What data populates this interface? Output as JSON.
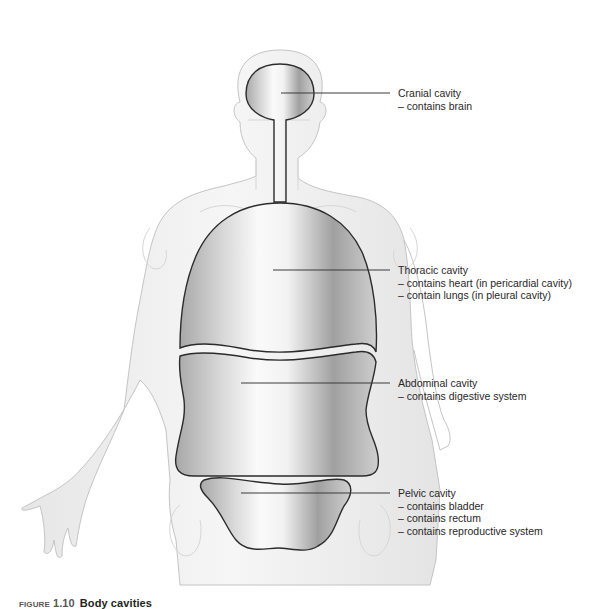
{
  "figure": {
    "caption_number": "FIGURE 1.10",
    "caption_title": "Body cavities"
  },
  "colors": {
    "body_fill": "#f0f0f0",
    "body_outline": "#c8c8c8",
    "cavity_outline": "#2b2b2b",
    "cavity_shade_dark": "#9a9a9a",
    "cavity_shade_light": "#f4f4f4",
    "leader_line": "#3a3a3a",
    "text": "#2a2627"
  },
  "labels": [
    {
      "id": "cranial",
      "title": "Cranial cavity",
      "lines": [
        "– contains brain"
      ]
    },
    {
      "id": "thoracic",
      "title": "Thoracic cavity",
      "lines": [
        "– contains heart (in pericardial cavity)",
        "– contain lungs (in pleural cavity)"
      ]
    },
    {
      "id": "abdominal",
      "title": "Abdominal cavity",
      "lines": [
        "– contains digestive system"
      ]
    },
    {
      "id": "pelvic",
      "title": "Pelvic cavity",
      "lines": [
        "– contains bladder",
        "– contains rectum",
        "– contains reproductive system"
      ]
    }
  ]
}
